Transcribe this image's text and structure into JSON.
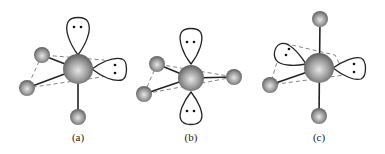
{
  "figure": {
    "panels": [
      {
        "id": "a",
        "label": "(a)",
        "lone_pairs": 2,
        "ligands": 3
      },
      {
        "id": "b",
        "label": "(b)",
        "lone_pairs": 2,
        "ligands": 3
      },
      {
        "id": "c",
        "label": "(c)",
        "lone_pairs": 2,
        "ligands": 3
      }
    ]
  },
  "colors": {
    "atom_light": "#e6e6e6",
    "atom_mid": "#9a9a9a",
    "atom_dark": "#5e5e5e",
    "line": "#222222",
    "dashed": "#666666"
  }
}
